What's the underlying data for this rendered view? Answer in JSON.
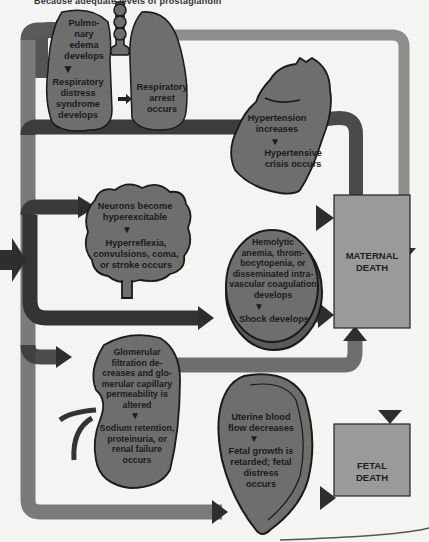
{
  "caption": {
    "text": "Because adequate levels of prostaglandin",
    "text_tail": "..."
  },
  "organs": {
    "lungs": {
      "left_text_1": "Pulmo-\nnary\nedema\ndevelops",
      "left_text_2": "Respiratory\ndistress\nsyndrome\ndevelops",
      "right_text": "Respiratory\narrest\noccurs"
    },
    "heart": {
      "text_1": "Hypertension\nincreases",
      "text_2": "Hypertensive\ncrisis occurs"
    },
    "brain": {
      "text_1": "Neurons become\nhyperexcitable",
      "text_2": "Hyperreflexia,\nconvulsions, coma,\nor stroke occurs"
    },
    "blood": {
      "text_1": "Hemolytic\nanemia, throm-\nbocytopenia, or\ndisseminated intra-\nvascular coagulation\ndevelops",
      "text_2": "Shock develops"
    },
    "kidney": {
      "text_1": "Glomerular\nfiltration de-\ncreases and glo-\nmerular capillary\npermeability is\naltered",
      "text_2": "Sodium retention,\nproteinuria, or\nrenal failure\noccurs"
    },
    "uterus": {
      "text_1": "Uterine blood\nflow decreases",
      "text_2": "Fetal growth is\nretarded; fetal\ndistress\noccurs"
    }
  },
  "outcomes": {
    "maternal": "MATERNAL\nDEATH",
    "fetal": "FETAL\nDEATH"
  },
  "colors": {
    "background": "#f4f4f2",
    "organ_fill": "#6e6e6e",
    "organ_stroke": "#1a1a1a",
    "arrow_dark": "#3a3a3a",
    "arrow_light": "#8c8c8c",
    "box_fill": "#9a9a9a"
  }
}
